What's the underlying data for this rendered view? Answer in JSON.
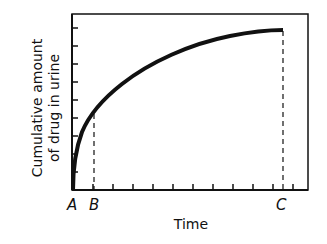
{
  "chart_data": {
    "type": "line",
    "title": "",
    "xlabel": "Time",
    "ylabel": [
      "Cumulative amount",
      "of drug in urine"
    ],
    "x_point_labels": [
      {
        "label": "A",
        "position": "origin"
      },
      {
        "label": "B",
        "position": "early time, ~1 tick"
      },
      {
        "label": "C",
        "position": "late time, plateau"
      }
    ],
    "series": [
      {
        "name": "Cumulative amount of drug in urine",
        "description": "Rises steeply from A then approaches a plateau at C",
        "x": [
          0,
          0.1,
          0.3,
          0.6,
          1.0,
          1.4,
          1.9,
          2.4,
          2.8,
          3.4,
          4.0,
          5.0,
          6.4,
          7.9,
          9.4,
          10.5
        ],
        "y": [
          0,
          0.9,
          2.3,
          3.4,
          4.2,
          5.0,
          5.6,
          6.1,
          6.6,
          7.0,
          7.4,
          8.0,
          8.5,
          8.8,
          9.0,
          9.05
        ]
      }
    ],
    "reference_lines": [
      {
        "at": "B",
        "style": "dashed",
        "from": "x-axis",
        "to": "curve"
      },
      {
        "at": "C",
        "style": "dashed",
        "from": "x-axis",
        "to": "curve"
      }
    ],
    "x_ticks": 11,
    "y_ticks": 9,
    "tick_labels": "none",
    "grid": false,
    "legend": "none"
  }
}
